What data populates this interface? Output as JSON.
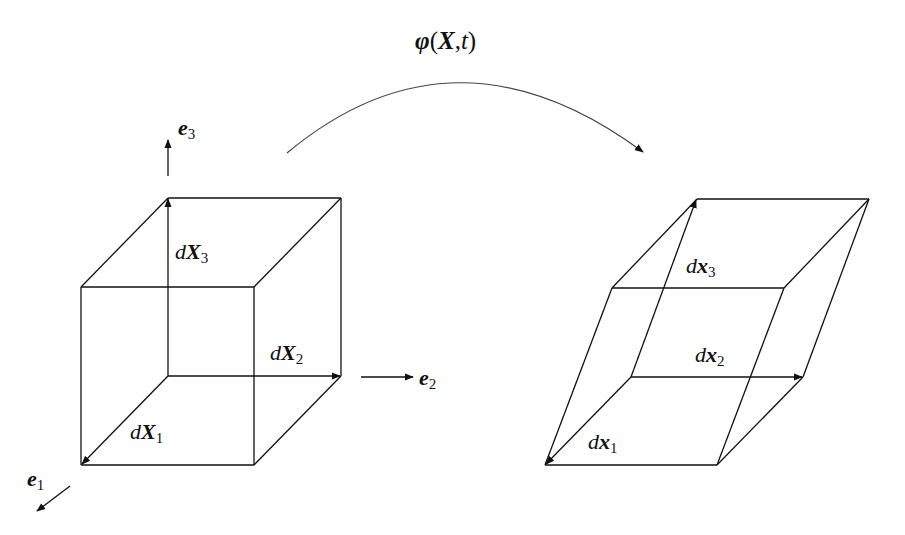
{
  "diagram": {
    "mapping": {
      "symbol": "φ",
      "args_open": "(",
      "arg1": "X",
      "sep": ",",
      "arg2": "t",
      "args_close": ")"
    },
    "basis": {
      "e1": {
        "base": "e",
        "sub": "1"
      },
      "e2": {
        "base": "e",
        "sub": "2"
      },
      "e3": {
        "base": "e",
        "sub": "3"
      }
    },
    "reference_cube": {
      "labels": [
        {
          "d": "d",
          "vec": "X",
          "sub": "1"
        },
        {
          "d": "d",
          "vec": "X",
          "sub": "2"
        },
        {
          "d": "d",
          "vec": "X",
          "sub": "3"
        }
      ]
    },
    "deformed_parallelepiped": {
      "labels": [
        {
          "d": "d",
          "vec": "x",
          "sub": "1"
        },
        {
          "d": "d",
          "vec": "x",
          "sub": "2"
        },
        {
          "d": "d",
          "vec": "x",
          "sub": "3"
        }
      ]
    },
    "line_color": "#111111"
  }
}
